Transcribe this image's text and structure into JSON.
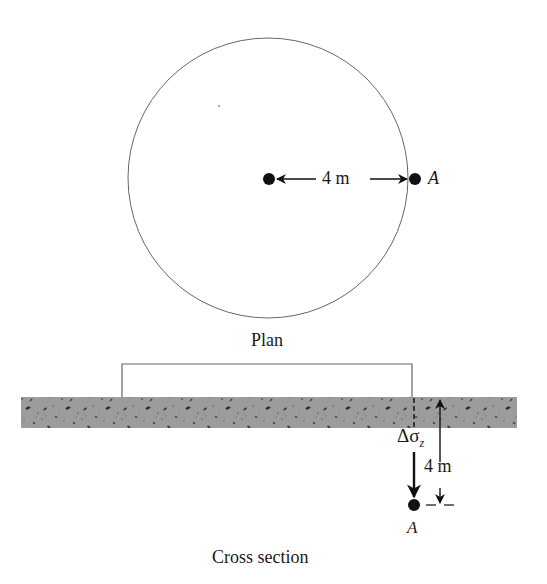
{
  "plan": {
    "caption": "Plan",
    "dimension_label": "4 m",
    "point_label": "A",
    "circle": {
      "cx": 268,
      "cy": 178,
      "r": 140
    },
    "center_point": {
      "x": 269,
      "y": 179
    },
    "point_a": {
      "x": 415,
      "y": 179
    }
  },
  "cross_section": {
    "caption": "Cross section",
    "stress_label_prefix": "Δσ",
    "stress_label_subscript": "z",
    "depth_label": "4 m",
    "point_label": "A",
    "footing": {
      "x1": 122,
      "x2": 412,
      "top": 364,
      "bottom": 397
    },
    "soil_layer": {
      "x1": 21,
      "x2": 517,
      "top": 397,
      "bottom": 428
    },
    "point_a": {
      "x": 414,
      "y": 505
    }
  },
  "colors": {
    "line": "#555555",
    "soil_fill": "#9a9a9a",
    "soil_speck": "#3a3a3a",
    "ink": "#111111"
  }
}
